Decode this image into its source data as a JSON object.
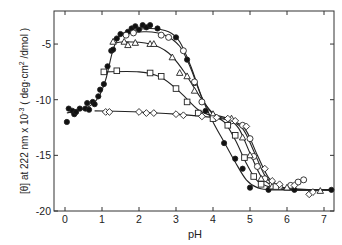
{
  "chart_data": {
    "type": "scatter",
    "title": "",
    "xlabel": "pH",
    "ylabel": "[θ] at 222 nm x 10^-3 ( deg·cm^2 /dmol )",
    "ylabel_parts": {
      "main": "[θ] at 222 nm x 10",
      "exp": "-3",
      "unit_pre": "( deg·cm",
      "unit_exp": "2",
      "unit_post": " /dmol )"
    },
    "xlim": [
      -0.3,
      7.3
    ],
    "ylim": [
      -20,
      -2
    ],
    "xticks": [
      0,
      1,
      2,
      3,
      4,
      5,
      6,
      7
    ],
    "xtick_labels": [
      "0",
      "1",
      "2",
      "3",
      "4",
      "5",
      "6",
      "7"
    ],
    "yticks": [
      -5,
      -10,
      -15,
      -20
    ],
    "ytick_labels": [
      "-5",
      "-10",
      "-15",
      "-20"
    ],
    "grid": false,
    "legend": "none",
    "series": [
      {
        "name": "filled circles",
        "marker": "filled-circle",
        "points": [
          [
            0.05,
            -12.0
          ],
          [
            0.1,
            -10.8
          ],
          [
            0.2,
            -11.0
          ],
          [
            0.25,
            -11.3
          ],
          [
            0.3,
            -11.1
          ],
          [
            0.4,
            -10.8
          ],
          [
            0.55,
            -10.8
          ],
          [
            0.6,
            -10.3
          ],
          [
            0.65,
            -10.9
          ],
          [
            0.75,
            -10.2
          ],
          [
            0.8,
            -10.4
          ],
          [
            0.9,
            -9.7
          ],
          [
            0.95,
            -9.1
          ],
          [
            1.05,
            -8.6
          ],
          [
            1.15,
            -7.0
          ],
          [
            1.25,
            -5.6
          ],
          [
            1.3,
            -5.5
          ],
          [
            1.4,
            -4.5
          ],
          [
            1.5,
            -4.1
          ],
          [
            1.7,
            -3.9
          ],
          [
            1.8,
            -3.6
          ],
          [
            1.9,
            -3.4
          ],
          [
            2.0,
            -3.7
          ],
          [
            2.1,
            -3.3
          ],
          [
            2.2,
            -3.5
          ],
          [
            2.3,
            -3.3
          ],
          [
            2.5,
            -3.6
          ],
          [
            3.0,
            -4.4
          ],
          [
            3.3,
            -6.4
          ],
          [
            3.5,
            -8.5
          ],
          [
            3.8,
            -11.0
          ],
          [
            4.3,
            -13.9
          ],
          [
            4.6,
            -15.3
          ],
          [
            4.8,
            -16.2
          ],
          [
            5.0,
            -17.9
          ],
          [
            5.5,
            -18.1
          ],
          [
            6.2,
            -18.1
          ],
          [
            7.2,
            -18.1
          ]
        ],
        "curve": [
          [
            0.05,
            -11.2
          ],
          [
            0.6,
            -10.7
          ],
          [
            0.9,
            -9.8
          ],
          [
            1.1,
            -8.2
          ],
          [
            1.3,
            -5.5
          ],
          [
            1.5,
            -4.2
          ],
          [
            1.8,
            -3.8
          ],
          [
            2.3,
            -3.6
          ],
          [
            2.8,
            -3.9
          ],
          [
            3.1,
            -4.8
          ],
          [
            3.4,
            -7.0
          ],
          [
            3.7,
            -9.8
          ],
          [
            4.0,
            -12.0
          ],
          [
            4.3,
            -13.8
          ],
          [
            4.6,
            -15.6
          ],
          [
            4.9,
            -17.2
          ],
          [
            5.2,
            -17.9
          ],
          [
            5.6,
            -18.1
          ],
          [
            7.2,
            -18.1
          ]
        ]
      },
      {
        "name": "open circles",
        "marker": "open-circle",
        "points": [
          [
            1.65,
            -4.2
          ],
          [
            1.85,
            -4.0
          ],
          [
            2.6,
            -4.2
          ],
          [
            2.8,
            -4.4
          ],
          [
            3.2,
            -5.6
          ],
          [
            3.5,
            -8.4
          ],
          [
            3.7,
            -10.2
          ],
          [
            4.5,
            -11.9
          ],
          [
            4.8,
            -12.3
          ],
          [
            5.0,
            -13.5
          ],
          [
            5.1,
            -15.1
          ],
          [
            5.2,
            -16.0
          ],
          [
            5.4,
            -17.1
          ],
          [
            5.6,
            -17.6
          ],
          [
            5.8,
            -17.8
          ],
          [
            6.1,
            -17.7
          ],
          [
            6.3,
            -17.4
          ],
          [
            6.45,
            -17.2
          ]
        ],
        "curve": [
          [
            1.3,
            -4.6
          ],
          [
            1.6,
            -4.1
          ],
          [
            2.2,
            -3.9
          ],
          [
            2.7,
            -4.2
          ],
          [
            3.1,
            -5.2
          ],
          [
            3.4,
            -7.2
          ],
          [
            3.7,
            -9.8
          ],
          [
            4.0,
            -11.3
          ],
          [
            4.4,
            -11.8
          ],
          [
            4.8,
            -12.6
          ],
          [
            5.1,
            -14.6
          ],
          [
            5.4,
            -16.8
          ],
          [
            5.7,
            -17.7
          ],
          [
            6.2,
            -18.0
          ],
          [
            7.2,
            -18.1
          ]
        ]
      },
      {
        "name": "open triangles",
        "marker": "open-triangle",
        "points": [
          [
            1.3,
            -4.8
          ],
          [
            1.6,
            -4.8
          ],
          [
            1.7,
            -5.1
          ],
          [
            1.9,
            -4.9
          ],
          [
            2.3,
            -5.0
          ],
          [
            2.4,
            -5.0
          ],
          [
            2.9,
            -6.2
          ],
          [
            3.1,
            -7.6
          ],
          [
            3.3,
            -7.9
          ],
          [
            3.5,
            -9.2
          ],
          [
            4.0,
            -11.3
          ],
          [
            4.5,
            -11.7
          ],
          [
            4.8,
            -13.4
          ],
          [
            5.0,
            -15.0
          ],
          [
            5.3,
            -17.1
          ],
          [
            5.6,
            -17.8
          ],
          [
            6.0,
            -17.9
          ],
          [
            6.9,
            -18.2
          ]
        ],
        "curve": [
          [
            1.25,
            -5.0
          ],
          [
            1.6,
            -4.8
          ],
          [
            2.3,
            -5.0
          ],
          [
            2.8,
            -5.8
          ],
          [
            3.2,
            -7.4
          ],
          [
            3.6,
            -9.5
          ],
          [
            4.0,
            -11.2
          ],
          [
            4.4,
            -11.7
          ],
          [
            4.7,
            -12.6
          ],
          [
            5.0,
            -14.8
          ],
          [
            5.3,
            -16.9
          ],
          [
            5.6,
            -17.7
          ],
          [
            6.1,
            -18.0
          ],
          [
            7.2,
            -18.1
          ]
        ]
      },
      {
        "name": "open squares",
        "marker": "open-square",
        "points": [
          [
            1.05,
            -7.5
          ],
          [
            1.4,
            -7.4
          ],
          [
            2.3,
            -7.6
          ],
          [
            2.6,
            -7.9
          ],
          [
            3.0,
            -9.0
          ],
          [
            3.3,
            -10.2
          ],
          [
            3.6,
            -11.2
          ],
          [
            4.0,
            -11.7
          ],
          [
            4.4,
            -12.3
          ],
          [
            4.6,
            -13.2
          ],
          [
            4.85,
            -15.2
          ],
          [
            5.1,
            -16.9
          ],
          [
            5.3,
            -17.6
          ],
          [
            5.7,
            -17.8
          ]
        ],
        "curve": [
          [
            1.05,
            -7.5
          ],
          [
            2.0,
            -7.5
          ],
          [
            2.6,
            -8.0
          ],
          [
            3.1,
            -9.3
          ],
          [
            3.6,
            -10.9
          ],
          [
            4.0,
            -11.5
          ],
          [
            4.3,
            -12.0
          ],
          [
            4.6,
            -13.6
          ],
          [
            4.9,
            -15.7
          ],
          [
            5.2,
            -17.3
          ],
          [
            5.6,
            -17.9
          ],
          [
            6.1,
            -18.1
          ],
          [
            7.2,
            -18.1
          ]
        ]
      },
      {
        "name": "open diamonds",
        "marker": "open-diamond",
        "points": [
          [
            1.1,
            -11.1
          ],
          [
            1.2,
            -11.1
          ],
          [
            2.0,
            -11.1
          ],
          [
            2.2,
            -11.2
          ],
          [
            2.4,
            -11.2
          ],
          [
            3.0,
            -11.3
          ],
          [
            3.2,
            -11.4
          ],
          [
            3.7,
            -11.5
          ],
          [
            4.1,
            -11.6
          ],
          [
            4.4,
            -11.7
          ],
          [
            4.6,
            -11.9
          ],
          [
            4.9,
            -12.4
          ],
          [
            5.4,
            -16.2
          ],
          [
            5.6,
            -17.3
          ],
          [
            5.8,
            -17.6
          ],
          [
            6.2,
            -17.7
          ],
          [
            6.6,
            -18.5
          ],
          [
            6.7,
            -18.3
          ]
        ],
        "curve": [
          [
            0.8,
            -11.0
          ],
          [
            2.0,
            -11.1
          ],
          [
            3.0,
            -11.3
          ],
          [
            4.0,
            -11.6
          ],
          [
            4.6,
            -12.0
          ],
          [
            4.9,
            -12.8
          ],
          [
            5.2,
            -15.0
          ],
          [
            5.5,
            -17.0
          ],
          [
            5.8,
            -17.8
          ],
          [
            6.2,
            -18.1
          ],
          [
            7.2,
            -18.1
          ]
        ]
      }
    ]
  }
}
